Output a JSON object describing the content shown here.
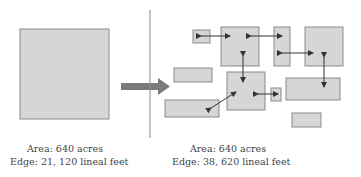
{
  "colors": {
    "fill": "#d6d6d6",
    "stroke": "#8a8a8a",
    "arrow": "#7a7a7a",
    "divider": "#8a8a8a",
    "double_arrow": "#333333"
  },
  "left": {
    "caption": {
      "area": "Area: 640 acres",
      "edge": "Edge: 21, 120 lineal feet"
    }
  },
  "right": {
    "caption": {
      "area": "Area: 640 acres",
      "edge": "Edge: 38, 620 lineal feet"
    }
  }
}
